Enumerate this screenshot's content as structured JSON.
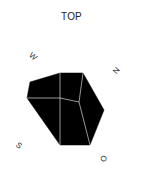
{
  "view": {
    "title": "TOP",
    "labels": {
      "w": "W",
      "n": "N",
      "s": "S",
      "o": "O"
    },
    "colors": {
      "fill": "#000000",
      "edge": "#d9d9d9",
      "background": "#ffffff",
      "text": "#333333"
    },
    "outline_polygon": [
      [
        30,
        82
      ],
      [
        60,
        73
      ],
      [
        83,
        73
      ],
      [
        104,
        110
      ],
      [
        90,
        145
      ],
      [
        60,
        145
      ],
      [
        27,
        98
      ]
    ],
    "inner_edges": [
      [
        [
          60,
          73
        ],
        [
          60,
          145
        ]
      ],
      [
        [
          27,
          98
        ],
        [
          60,
          98
        ],
        [
          79,
          102
        ]
      ],
      [
        [
          83,
          73
        ],
        [
          79,
          102
        ],
        [
          90,
          145
        ]
      ]
    ]
  }
}
